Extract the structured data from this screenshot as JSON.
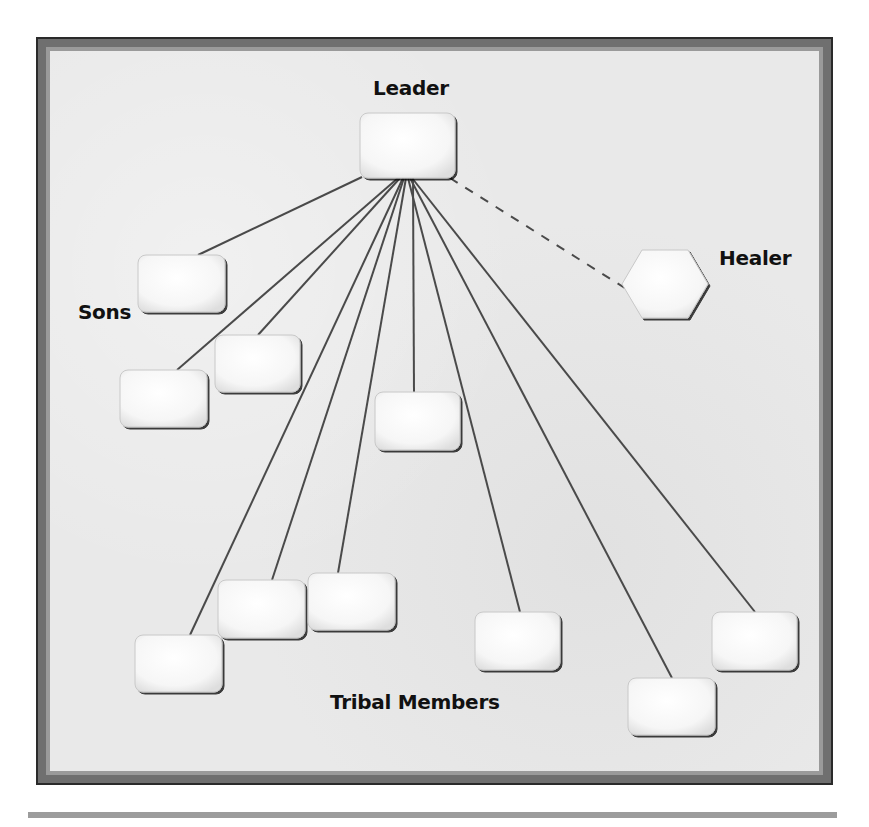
{
  "labels": {
    "leader": "Leader",
    "healer": "Healer",
    "sons": "Sons",
    "tribal_members": "Tribal Members"
  },
  "colors": {
    "line": "#4a4a4a",
    "box_fill": "#fbfbfb",
    "box_edge": "#555555",
    "frame_inner": "#e9e9e9",
    "frame_band": "#9a9a9a",
    "frame_outer": "#2a2a2a"
  },
  "nodes": {
    "leader": {
      "x": 360,
      "y": 113,
      "w": 95,
      "h": 65,
      "shape": "rounded-rect"
    },
    "healer": {
      "cx": 665,
      "cy": 284,
      "w": 86,
      "h": 68,
      "shape": "hexagon"
    },
    "sons": [
      {
        "x": 138,
        "y": 255,
        "w": 87,
        "h": 57
      },
      {
        "x": 215,
        "y": 335,
        "w": 85,
        "h": 57
      },
      {
        "x": 120,
        "y": 370,
        "w": 87,
        "h": 57
      }
    ],
    "members": [
      {
        "x": 375,
        "y": 392,
        "w": 85,
        "h": 58
      },
      {
        "x": 135,
        "y": 635,
        "w": 87,
        "h": 57
      },
      {
        "x": 218,
        "y": 580,
        "w": 87,
        "h": 58
      },
      {
        "x": 308,
        "y": 573,
        "w": 87,
        "h": 57
      },
      {
        "x": 475,
        "y": 612,
        "w": 85,
        "h": 58
      },
      {
        "x": 628,
        "y": 678,
        "w": 87,
        "h": 57
      },
      {
        "x": 712,
        "y": 612,
        "w": 85,
        "h": 58
      }
    ]
  },
  "edges": [
    {
      "from": [
        362,
        177
      ],
      "to": [
        198,
        255
      ],
      "style": "solid",
      "target": "son-1"
    },
    {
      "from": [
        400,
        178
      ],
      "to": [
        258,
        335
      ],
      "style": "solid",
      "target": "son-2"
    },
    {
      "from": [
        398,
        178
      ],
      "to": [
        177,
        370
      ],
      "style": "solid",
      "target": "son-3"
    },
    {
      "from": [
        413,
        178
      ],
      "to": [
        414,
        392
      ],
      "style": "solid",
      "target": "member-1"
    },
    {
      "from": [
        403,
        178
      ],
      "to": [
        190,
        635
      ],
      "style": "solid",
      "target": "member-2"
    },
    {
      "from": [
        404,
        178
      ],
      "to": [
        272,
        580
      ],
      "style": "solid",
      "target": "member-3"
    },
    {
      "from": [
        406,
        178
      ],
      "to": [
        338,
        573
      ],
      "style": "solid",
      "target": "member-4"
    },
    {
      "from": [
        408,
        178
      ],
      "to": [
        520,
        612
      ],
      "style": "solid",
      "target": "member-5"
    },
    {
      "from": [
        410,
        178
      ],
      "to": [
        672,
        678
      ],
      "style": "solid",
      "target": "member-6"
    },
    {
      "from": [
        412,
        178
      ],
      "to": [
        755,
        612
      ],
      "style": "solid",
      "target": "member-7"
    },
    {
      "from": [
        450,
        178
      ],
      "to": [
        628,
        290
      ],
      "style": "dashed",
      "target": "healer"
    }
  ]
}
